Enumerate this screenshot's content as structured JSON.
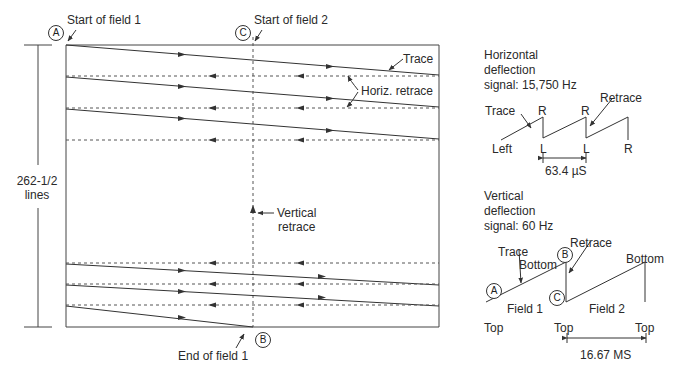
{
  "raster": {
    "start_field1": "Start of field 1",
    "start_field2": "Start of field 2",
    "end_field1": "End of field 1",
    "trace": "Trace",
    "horiz_retrace": "Horiz. retrace",
    "vertical_retrace": "Vertical\nretrace",
    "lines_label": "262-1/2\nlines",
    "point_a": "A",
    "point_b": "B",
    "point_c": "C"
  },
  "horizontal_signal": {
    "title": "Horizontal\ndeflection\nsignal: 15,750 Hz",
    "trace": "Trace",
    "retrace": "Retrace",
    "left": "Left",
    "r1": "R",
    "r2": "R",
    "r3": "R",
    "l1": "L",
    "l2": "L",
    "period": "63.4 µS"
  },
  "vertical_signal": {
    "title": "Vertical\ndeflection\nsignal: 60 Hz",
    "trace": "Trace",
    "retrace": "Retrace",
    "bottom1": "Bottom",
    "bottom2": "Bottom",
    "field1": "Field 1",
    "field2": "Field 2",
    "top1": "Top",
    "top2": "Top",
    "top3": "Top",
    "period": "16.67 MS",
    "point_a": "A",
    "point_b": "B",
    "point_c": "C"
  },
  "colors": {
    "line": "#333333",
    "background": "#ffffff"
  }
}
